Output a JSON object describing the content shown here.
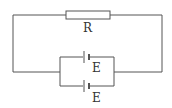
{
  "diagram": {
    "type": "circuit",
    "resistor": {
      "label": "R"
    },
    "batteries": [
      {
        "label": "E"
      },
      {
        "label": "E"
      }
    ],
    "colors": {
      "line": "#555555",
      "background": "#ffffff"
    }
  }
}
